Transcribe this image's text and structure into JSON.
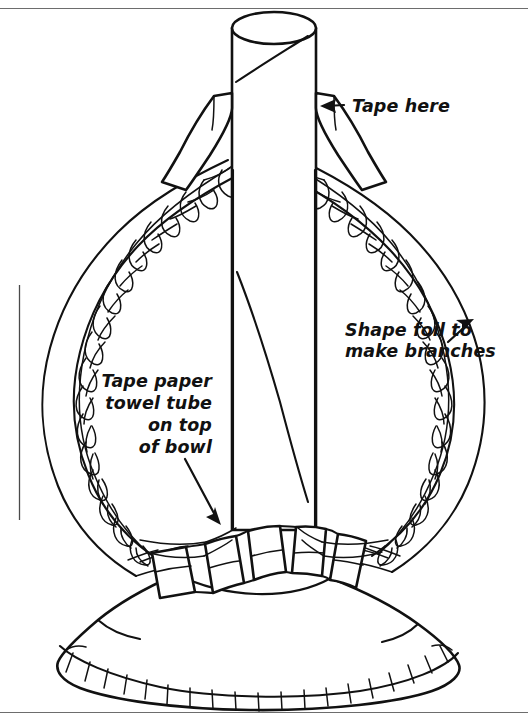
{
  "document": {
    "type": "instructional-line-drawing",
    "title": "Foil tree craft assembly diagram",
    "background_color": "#ffffff",
    "ink_color": "#111111",
    "frame_color": "#6d6d6d"
  },
  "annotations": [
    {
      "id": "tape-here",
      "text": "Tape here",
      "text_x": 352,
      "text_y": 112,
      "align": "start",
      "arrow": {
        "from_x": 344,
        "from_y": 105,
        "to_x": 322,
        "to_y": 106
      },
      "points_to": "tape-strip-upper-right"
    },
    {
      "id": "shape-foil",
      "lines": [
        "Shape foil to",
        "make branches"
      ],
      "text_x": 345,
      "text_y": 336,
      "align": "start",
      "arrow": {
        "from_x": 448,
        "from_y": 342,
        "to_x": 473,
        "to_y": 320
      },
      "points_to": "foil-branch-right"
    },
    {
      "id": "tape-tube-on-bowl",
      "lines": [
        "Tape paper",
        "towel tube",
        "on top",
        "of bowl"
      ],
      "text_x": 212,
      "text_y": 387,
      "align": "end",
      "arrow": {
        "from_x": 185,
        "from_y": 458,
        "to_x": 222,
        "to_y": 524
      },
      "points_to": "tube-base-tape"
    }
  ],
  "objects": [
    {
      "name": "paper-towel-tube",
      "description": "vertical cardboard tube with elliptical open top"
    },
    {
      "name": "foil-wreath",
      "description": "crinkled aluminium foil loop forming branches"
    },
    {
      "name": "bowl",
      "description": "upturned bowl base with fluted rim"
    },
    {
      "name": "tape-strips",
      "description": "strips of tape securing tube and foil"
    }
  ],
  "frame": {
    "top_y": 8,
    "bottom_y": 712,
    "left_x": 19,
    "right_x": 520
  }
}
